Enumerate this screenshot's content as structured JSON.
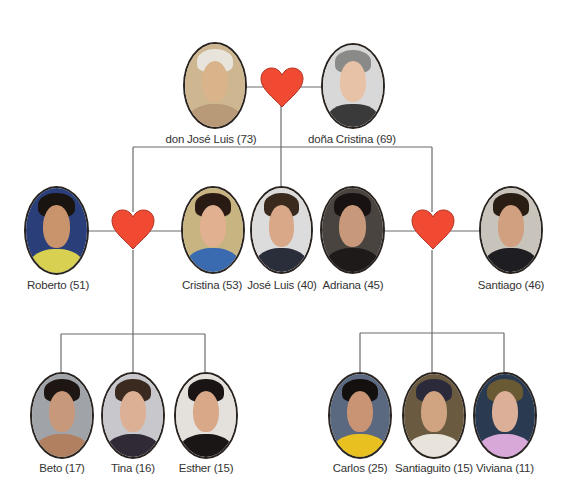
{
  "diagram": {
    "type": "family-tree",
    "colors": {
      "heart": "#f04a33",
      "heart_outline": "#b03020",
      "connector": "#6b6b6b",
      "label": "#333333"
    },
    "generation_1": {
      "couple": [
        {
          "name": "don José Luis (73)",
          "skin": "#d9b48a",
          "hair": "#e8e4dc",
          "bg": "#cdb690",
          "body": "#b89a78"
        },
        {
          "name": "doña Cristina (69)",
          "skin": "#e8c2a6",
          "hair": "#8a8a88",
          "bg": "#d8d8d8",
          "body": "#3a3a3a"
        }
      ]
    },
    "generation_2": {
      "couple_left": [
        {
          "name": "Roberto (51)",
          "skin": "#c9946c",
          "hair": "#1a1410",
          "bg": "#2a3f7a",
          "body": "#d8d050"
        },
        {
          "name": "Cristina (53)",
          "skin": "#e0b090",
          "hair": "#2a1a14",
          "bg": "#c8b480",
          "body": "#3a6ab0"
        }
      ],
      "single": {
        "name": "José Luis (40)",
        "skin": "#d8a888",
        "hair": "#3a2a1e",
        "bg": "#dcdcdc",
        "body": "#2a2e3a"
      },
      "couple_right": [
        {
          "name": "Adriana (45)",
          "skin": "#c8987a",
          "hair": "#181212",
          "bg": "#4a4440",
          "body": "#1e1a1a"
        },
        {
          "name": "Santiago (46)",
          "skin": "#d0a080",
          "hair": "#2a1e14",
          "bg": "#c8c4bc",
          "body": "#1e1e22"
        }
      ]
    },
    "generation_3": {
      "left_children": [
        {
          "name": "Beto (17)",
          "skin": "#c8987a",
          "hair": "#1e1612",
          "bg": "#a0a4a8",
          "body": "#b08060"
        },
        {
          "name": "Tina (16)",
          "skin": "#dcb094",
          "hair": "#3a2a20",
          "bg": "#c8c8cc",
          "body": "#302a36"
        },
        {
          "name": "Esther (15)",
          "skin": "#d8a888",
          "hair": "#1a1414",
          "bg": "#e4e0dc",
          "body": "#1a1616"
        }
      ],
      "right_children": [
        {
          "name": "Carlos (25)",
          "skin": "#c89474",
          "hair": "#141010",
          "bg": "#5a6880",
          "body": "#e8c020"
        },
        {
          "name": "Santiaguito (15)",
          "skin": "#d0a480",
          "hair": "#2a2a3a",
          "bg": "#6a5a40",
          "body": "#e8e4dc"
        },
        {
          "name": "Viviana (11)",
          "skin": "#dcb098",
          "hair": "#6a5a34",
          "bg": "#2a3a50",
          "body": "#d8a8d8"
        }
      ]
    }
  }
}
